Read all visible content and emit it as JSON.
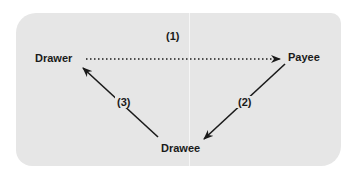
{
  "diagram": {
    "nodes": {
      "drawer": "Drawer",
      "payee": "Payee",
      "drawee": "Drawee"
    },
    "edges": [
      {
        "label": "(1)",
        "from": "Drawer",
        "to": "Payee",
        "style": "dotted"
      },
      {
        "label": "(2)",
        "from": "Payee",
        "to": "Drawee",
        "style": "solid"
      },
      {
        "label": "(3)",
        "from": "Drawee",
        "to": "Drawer",
        "style": "solid"
      }
    ],
    "colors": {
      "panel": "#e6e6e6",
      "ink": "#1a1a1a"
    }
  }
}
